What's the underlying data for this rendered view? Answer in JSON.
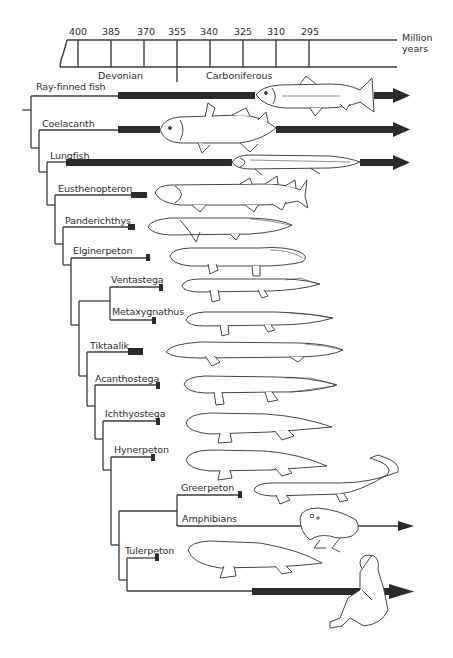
{
  "timeline": {
    "unit_line1": "Million",
    "unit_line2": "years",
    "ticks": [
      {
        "label": "400",
        "x": 78
      },
      {
        "label": "385",
        "x": 111
      },
      {
        "label": "370",
        "x": 144
      },
      {
        "label": "355",
        "x": 177
      },
      {
        "label": "340",
        "x": 210
      },
      {
        "label": "325",
        "x": 243
      },
      {
        "label": "310",
        "x": 276
      },
      {
        "label": "295",
        "x": 309
      }
    ],
    "periods": [
      {
        "name": "Devonian"
      },
      {
        "name": "Carboniferous"
      }
    ]
  },
  "taxa": [
    {
      "name": "Ray-finned fish",
      "extant": true
    },
    {
      "name": "Coelacanth",
      "extant": true
    },
    {
      "name": "Lungfish",
      "extant": true
    },
    {
      "name": "Eusthenopteron",
      "extant": false
    },
    {
      "name": "Panderichthys",
      "extant": false
    },
    {
      "name": "Elginerpeton",
      "extant": false
    },
    {
      "name": "Ventastega",
      "extant": false
    },
    {
      "name": "Metaxygnathus",
      "extant": false
    },
    {
      "name": "Tiktaalik",
      "extant": false
    },
    {
      "name": "Acanthostega",
      "extant": false
    },
    {
      "name": "Ichthyostega",
      "extant": false
    },
    {
      "name": "Hynerpeton",
      "extant": false
    },
    {
      "name": "Greerpeton",
      "extant": false
    },
    {
      "name": "Amphibians",
      "extant": true
    },
    {
      "name": "Tulerpeton",
      "extant": false
    },
    {
      "name": "Humans (amniotes)",
      "extant": true,
      "label_visible": false
    }
  ],
  "colors": {
    "line": "#3a3a3a",
    "bar": "#2b2b2b",
    "drawing": "#444444",
    "background": "#ffffff"
  }
}
